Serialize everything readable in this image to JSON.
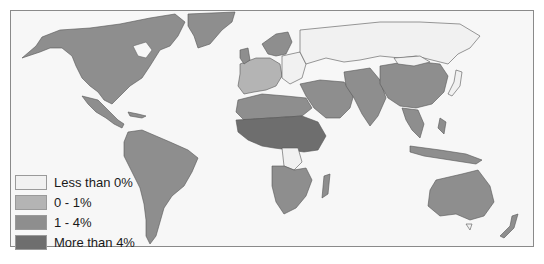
{
  "map": {
    "type": "choropleth-world",
    "categories": [
      {
        "label": "Less than 0%",
        "color": "#f1f1f1"
      },
      {
        "label": "0 - 1%",
        "color": "#b4b4b4"
      },
      {
        "label": "1 - 4%",
        "color": "#8e8e8e"
      },
      {
        "label": "More than 4%",
        "color": "#6e6e6e"
      }
    ],
    "border_color": "#555555",
    "ocean_color": "#f7f7f7"
  },
  "legend": {
    "items": [
      {
        "label": "Less than 0%",
        "color": "#f1f1f1"
      },
      {
        "label": "0 - 1%",
        "color": "#b4b4b4"
      },
      {
        "label": "1 - 4%",
        "color": "#8e8e8e"
      },
      {
        "label": "More than 4%",
        "color": "#6e6e6e"
      }
    ]
  },
  "regions": {
    "north_america": "1 - 4%",
    "greenland": "1 - 4%",
    "central_america": "1 - 4%",
    "south_america": "1 - 4%",
    "western_europe": "0 - 1%",
    "eastern_europe": "Less than 0%",
    "russia": "Less than 0%",
    "japan_korea_mongolia": "Less than 0%",
    "middle_east": "1 - 4%",
    "north_africa": "1 - 4%",
    "sub_saharan_africa": "More than 4%",
    "dr_congo": "Less than 0%",
    "southern_africa": "1 - 4%",
    "china": "1 - 4%",
    "south_asia": "1 - 4%",
    "southeast_asia": "1 - 4%",
    "australia": "1 - 4%",
    "new_zealand": "1 - 4%"
  }
}
